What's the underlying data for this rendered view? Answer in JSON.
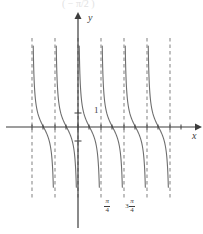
{
  "figure": {
    "background_color": "#ffffff",
    "axis_color": "#3c3c3c",
    "curve_color": "#6e6e6e",
    "asymptote_color": "#8c8c8c",
    "partial_caption": "(    − π/2 )"
  },
  "axes": {
    "y_label": "y",
    "x_label": "x",
    "unit_tick_label": "1",
    "origin_px": {
      "x": 78,
      "y": 127
    },
    "x_axis_start_px": 6,
    "x_axis_end_px": 196,
    "y_axis_top_px": 18,
    "y_axis_bottom_px": 228,
    "unit_y_px": 113,
    "neg_unit_y_px": 141
  },
  "ticks": {
    "x_labeled": [
      {
        "label_parts": {
          "lead": "",
          "numerator": "π",
          "denominator": "4"
        },
        "x_px": 105
      },
      {
        "label_parts": {
          "lead": "3",
          "numerator": "π",
          "denominator": "4"
        },
        "x_px": 128
      }
    ],
    "x_minor_px": [
      32,
      43,
      55,
      66,
      78,
      89,
      101,
      112,
      124,
      135,
      147,
      158,
      170,
      181
    ],
    "y_ticks_px": [
      113,
      141
    ]
  },
  "chart_data": {
    "type": "line",
    "title": "",
    "xlabel": "x",
    "ylabel": "y",
    "function": "decreasing cotangent-type curve, period π/2",
    "period": "π/2",
    "grid": false,
    "legend": null,
    "xlim": [
      -1.75,
      1.75
    ],
    "ylim": [
      -3.2,
      3.2
    ],
    "x_tick_values": [
      0.785398,
      2.356194
    ],
    "x_tick_labels": [
      "π/4",
      "3π/4"
    ],
    "y_tick_values": [
      1,
      -1
    ],
    "y_tick_labels": [
      "1",
      ""
    ],
    "asymptotes_px": [
      32,
      55,
      78,
      101,
      124,
      147,
      170
    ],
    "asymptote_spacing_px": 23,
    "asymptote_top_px": 38,
    "asymptote_bottom_px": 200,
    "branches": [
      {
        "left_asymptote_px": 32,
        "right_asymptote_px": 55,
        "x_intercept_px": 43.5,
        "direction": "decreasing"
      },
      {
        "left_asymptote_px": 55,
        "right_asymptote_px": 78,
        "x_intercept_px": 66.5,
        "direction": "decreasing"
      },
      {
        "left_asymptote_px": 78,
        "right_asymptote_px": 101,
        "x_intercept_px": 89.5,
        "direction": "decreasing"
      },
      {
        "left_asymptote_px": 101,
        "right_asymptote_px": 124,
        "x_intercept_px": 112.5,
        "direction": "decreasing"
      },
      {
        "left_asymptote_px": 124,
        "right_asymptote_px": 147,
        "x_intercept_px": 135.5,
        "direction": "decreasing"
      },
      {
        "left_asymptote_px": 147,
        "right_asymptote_px": 170,
        "x_intercept_px": 158.5,
        "direction": "decreasing"
      }
    ],
    "curve_top_px": 42,
    "curve_bottom_px": 196
  }
}
